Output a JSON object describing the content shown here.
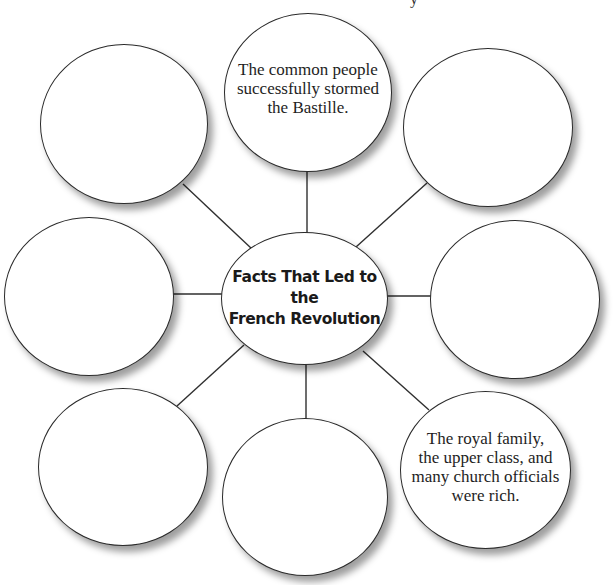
{
  "diagram": {
    "type": "web-organizer",
    "center": {
      "title": "Facts That Led to the\nFrench Revolution"
    },
    "top_fragment": "y",
    "nodes": [
      {
        "id": "top",
        "position": "top",
        "text": "The common people\nsuccessfully stormed\nthe Bastille."
      },
      {
        "id": "top-left",
        "position": "top-left",
        "text": ""
      },
      {
        "id": "top-right",
        "position": "top-right",
        "text": ""
      },
      {
        "id": "left",
        "position": "left",
        "text": ""
      },
      {
        "id": "right",
        "position": "right",
        "text": ""
      },
      {
        "id": "bottom-left",
        "position": "bottom-left",
        "text": ""
      },
      {
        "id": "bottom",
        "position": "bottom",
        "text": ""
      },
      {
        "id": "bottom-right",
        "position": "bottom-right",
        "text": "The royal family,\nthe upper class, and\nmany church officials\nwere rich."
      }
    ],
    "colors": {
      "stroke": "#2a2a2a",
      "fill": "#ffffff",
      "text": "#1e1e1e"
    }
  }
}
